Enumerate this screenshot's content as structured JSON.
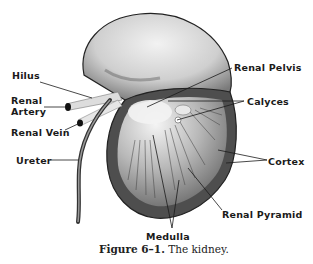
{
  "figure": {
    "number": "Figure 6–1.",
    "title": "The kidney."
  },
  "labels": {
    "hilus": "Hilus",
    "renal_artery_1": "Renal",
    "renal_artery_2": "Artery",
    "renal_vein": "Renal Vein",
    "ureter": "Ureter",
    "renal_pelvis": "Renal Pelvis",
    "calyces": "Calyces",
    "cortex": "Cortex",
    "renal_pyramid": "Renal Pyramid",
    "medulla": "Medulla"
  },
  "colors": {
    "ink": "#1a1a1a",
    "cortex_dark": "#555555",
    "kidney_light": "#d8d8d8",
    "background": "#ffffff"
  }
}
